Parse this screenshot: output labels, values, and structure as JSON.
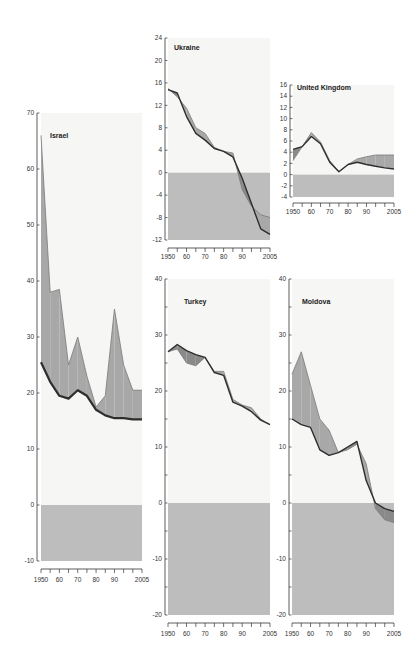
{
  "colors": {
    "plot_bg": "#f6f6f4",
    "negative_zone": "#bdbdbd",
    "band_light": "#a8a8a8",
    "band_dark": "#8a8a8a",
    "line_dark": "#2e2e2e",
    "axis": "#333333"
  },
  "chart_data": [
    {
      "type": "area",
      "title": "Israel",
      "x": [
        1950,
        1955,
        1960,
        1965,
        1970,
        1975,
        1980,
        1985,
        1990,
        1995,
        2000,
        2005
      ],
      "series": [
        {
          "name": "upper",
          "values": [
            66,
            38,
            38.5,
            25,
            30,
            23,
            17.5,
            19.5,
            35,
            25,
            20.5,
            20.5
          ]
        },
        {
          "name": "lower_line",
          "values": [
            25.5,
            22,
            19.5,
            19,
            20.5,
            19.5,
            17,
            16,
            15.5,
            15.5,
            15.3,
            15.3
          ]
        }
      ],
      "ylim": [
        -10,
        70
      ],
      "yticks": [
        -10,
        0,
        10,
        20,
        30,
        40,
        50,
        60,
        70
      ],
      "xtick_labels": [
        "1950",
        "60",
        "70",
        "80",
        "90",
        "2005"
      ]
    },
    {
      "type": "area",
      "title": "Ukraine",
      "x": [
        1950,
        1955,
        1960,
        1965,
        1970,
        1975,
        1980,
        1985,
        1990,
        1995,
        2000,
        2005
      ],
      "series": [
        {
          "name": "upper",
          "values": [
            15,
            13.5,
            11.5,
            8,
            7,
            4.5,
            3.8,
            3.5,
            -3,
            -6,
            -7.5,
            -8
          ]
        },
        {
          "name": "lower_line",
          "values": [
            14.8,
            14.2,
            10,
            7,
            5.8,
            4.3,
            3.8,
            2.8,
            -1,
            -5.5,
            -10,
            -11
          ]
        }
      ],
      "ylim": [
        -12,
        24
      ],
      "yticks": [
        -12,
        -8,
        -4,
        0,
        4,
        8,
        12,
        16,
        20,
        24
      ],
      "xtick_labels": [
        "1950",
        "60",
        "70",
        "80",
        "90",
        "2005"
      ]
    },
    {
      "type": "area",
      "title": "United Kingdom",
      "x": [
        1950,
        1955,
        1960,
        1965,
        1970,
        1975,
        1980,
        1985,
        1990,
        1995,
        2000,
        2005
      ],
      "series": [
        {
          "name": "upper",
          "values": [
            2.5,
            5,
            7.5,
            5.8,
            2.5,
            0.5,
            1.8,
            2.8,
            3.2,
            3.5,
            3.5,
            3.5
          ]
        },
        {
          "name": "lower_line",
          "values": [
            4.5,
            5,
            6.8,
            5.5,
            2.2,
            0.5,
            1.8,
            2.2,
            1.8,
            1.5,
            1.2,
            1.0
          ]
        }
      ],
      "ylim": [
        -4,
        16
      ],
      "yticks": [
        -4,
        -2,
        0,
        2,
        4,
        6,
        8,
        10,
        12,
        14,
        16
      ],
      "xtick_labels": [
        "1950",
        "60",
        "70",
        "80",
        "90",
        "2005"
      ]
    },
    {
      "type": "area",
      "title": "Turkey",
      "x": [
        1950,
        1955,
        1960,
        1965,
        1970,
        1975,
        1980,
        1985,
        1990,
        1995,
        2000,
        2005
      ],
      "series": [
        {
          "name": "upper",
          "values": [
            27,
            27.5,
            25,
            24.5,
            26,
            23.5,
            23.5,
            18.5,
            17.5,
            17,
            15,
            14
          ]
        },
        {
          "name": "lower_line",
          "values": [
            27,
            28.3,
            27.2,
            26.5,
            26,
            23.3,
            22.8,
            18,
            17.3,
            16.3,
            14.8,
            14
          ]
        }
      ],
      "ylim": [
        -20,
        40
      ],
      "yticks": [
        -20,
        -15,
        -10,
        -5,
        0,
        5,
        10,
        15,
        20,
        25,
        30,
        35,
        40
      ],
      "xtick_labels": [
        "1950",
        "60",
        "70",
        "80",
        "90",
        "2005"
      ]
    },
    {
      "type": "area",
      "title": "Moldova",
      "x": [
        1950,
        1955,
        1960,
        1965,
        1970,
        1975,
        1980,
        1985,
        1990,
        1995,
        2000,
        2005
      ],
      "series": [
        {
          "name": "upper",
          "values": [
            23,
            27,
            21,
            15,
            13,
            9,
            9.5,
            10.5,
            7,
            -1,
            -3,
            -3.5
          ]
        },
        {
          "name": "lower_line",
          "values": [
            15,
            14,
            13.5,
            9.5,
            8.5,
            9,
            10,
            11,
            4,
            0,
            -1,
            -1.5
          ]
        }
      ],
      "ylim": [
        -20,
        40
      ],
      "yticks": [
        -20,
        -15,
        -10,
        -5,
        0,
        5,
        10,
        15,
        20,
        25,
        30,
        35,
        40
      ],
      "xtick_labels": [
        "1950",
        "60",
        "70",
        "80",
        "90",
        "2005"
      ]
    }
  ],
  "panels": [
    {
      "key": "israel",
      "title": "Israel",
      "ylabels": [
        "70",
        "60",
        "50",
        "40",
        "30",
        "20",
        "10",
        "0",
        "-10"
      ]
    },
    {
      "key": "ukraine",
      "title": "Ukraine",
      "ylabels": [
        "24",
        "20",
        "16",
        "12",
        "8",
        "4",
        "0",
        "-4",
        "-8",
        "-12"
      ]
    },
    {
      "key": "uk",
      "title": "United Kingdom",
      "ylabels": [
        "16",
        "14",
        "12",
        "10",
        "8",
        "6",
        "4",
        "2",
        "0",
        "-2",
        "-4"
      ]
    },
    {
      "key": "turkey",
      "title": "Turkey",
      "ylabels": [
        "40",
        "30",
        "20",
        "10",
        "0",
        "-10",
        "-20"
      ]
    },
    {
      "key": "moldova",
      "title": "Moldova",
      "ylabels": [
        "40",
        "30",
        "20",
        "10",
        "0",
        "-10",
        "-20"
      ]
    }
  ]
}
